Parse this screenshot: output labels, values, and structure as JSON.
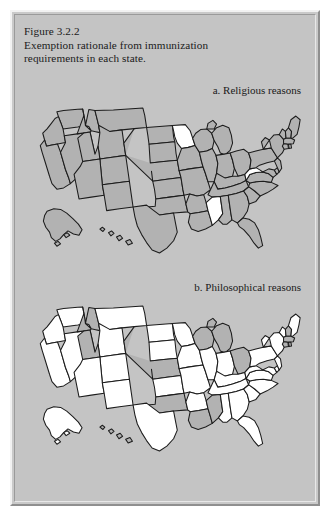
{
  "figure": {
    "number": "Figure 3.2.2",
    "caption_line1": "Exemption rationale from immunization",
    "caption_line2": "requirements in each state.",
    "panel_a_label": "a. Religious reasons",
    "panel_b_label": "b. Philosophical reasons"
  },
  "legend": {
    "shaded_meaning": "exemption allowed",
    "shaded_color": "#b2b2b2",
    "unshaded_color": "#ffffff",
    "outline_color": "#1c1c1c",
    "background_color": "#c4c4c4"
  },
  "chart_data": {
    "type": "map",
    "title": "Exemption rationale from immunization requirements in each state.",
    "subtitle": "Figure 3.2.2",
    "maps": [
      {
        "id": "a",
        "label": "a. Religious reasons",
        "shaded_color": "#b2b2b2",
        "unshaded_color": "#ffffff",
        "values": {
          "AL": 1,
          "AK": 1,
          "AZ": 1,
          "AR": 1,
          "CA": 1,
          "CO": 1,
          "CT": 1,
          "DE": 1,
          "FL": 1,
          "GA": 1,
          "HI": 1,
          "ID": 1,
          "IL": 1,
          "IN": 1,
          "IA": 1,
          "KS": 1,
          "KY": 1,
          "LA": 1,
          "ME": 1,
          "MD": 1,
          "MA": 1,
          "MI": 1,
          "MN": 0,
          "MS": 0,
          "MO": 1,
          "MT": 1,
          "NE": 1,
          "NV": 1,
          "NH": 1,
          "NJ": 1,
          "NM": 1,
          "NY": 1,
          "NC": 1,
          "ND": 1,
          "OH": 1,
          "OK": 1,
          "OR": 1,
          "PA": 1,
          "RI": 1,
          "SC": 1,
          "SD": 1,
          "TN": 1,
          "TX": 1,
          "UT": 1,
          "VT": 1,
          "VA": 1,
          "WA": 1,
          "WV": 0,
          "WI": 1,
          "WY": 1
        }
      },
      {
        "id": "b",
        "label": "b. Philosophical reasons",
        "shaded_color": "#b2b2b2",
        "unshaded_color": "#ffffff",
        "values": {
          "AL": 0,
          "AK": 0,
          "AZ": 0,
          "AR": 0,
          "CA": 0,
          "CO": 0,
          "CT": 1,
          "DE": 0,
          "FL": 0,
          "GA": 0,
          "HI": 1,
          "ID": 1,
          "IL": 0,
          "IN": 0,
          "IA": 0,
          "KS": 0,
          "KY": 0,
          "LA": 1,
          "ME": 0,
          "MD": 0,
          "MA": 1,
          "MI": 1,
          "MN": 0,
          "MS": 1,
          "MO": 0,
          "MT": 0,
          "NE": 1,
          "NV": 0,
          "NH": 1,
          "NJ": 0,
          "NM": 0,
          "NY": 0,
          "NC": 0,
          "ND": 0,
          "OH": 1,
          "OK": 1,
          "OR": 0,
          "PA": 0,
          "RI": 1,
          "SC": 0,
          "SD": 0,
          "TN": 0,
          "TX": 0,
          "UT": 1,
          "VT": 0,
          "VA": 0,
          "WA": 0,
          "WV": 0,
          "WI": 1,
          "WY": 0
        }
      }
    ],
    "value_meanings": {
      "0": "unshaded (white)",
      "1": "shaded (gray)"
    },
    "state_names": {
      "AL": "Alabama",
      "AK": "Alaska",
      "AZ": "Arizona",
      "AR": "Arkansas",
      "CA": "California",
      "CO": "Colorado",
      "CT": "Connecticut",
      "DE": "Delaware",
      "FL": "Florida",
      "GA": "Georgia",
      "HI": "Hawaii",
      "ID": "Idaho",
      "IL": "Illinois",
      "IN": "Indiana",
      "IA": "Iowa",
      "KS": "Kansas",
      "KY": "Kentucky",
      "LA": "Louisiana",
      "ME": "Maine",
      "MD": "Maryland",
      "MA": "Massachusetts",
      "MI": "Michigan",
      "MN": "Minnesota",
      "MS": "Mississippi",
      "MO": "Missouri",
      "MT": "Montana",
      "NE": "Nebraska",
      "NV": "Nevada",
      "NH": "New Hampshire",
      "NJ": "New Jersey",
      "NM": "New Mexico",
      "NY": "New York",
      "NC": "North Carolina",
      "ND": "North Dakota",
      "OH": "Ohio",
      "OK": "Oklahoma",
      "OR": "Oregon",
      "PA": "Pennsylvania",
      "RI": "Rhode Island",
      "SC": "South Carolina",
      "SD": "South Dakota",
      "TN": "Tennessee",
      "TX": "Texas",
      "UT": "Utah",
      "VT": "Vermont",
      "VA": "Virginia",
      "WA": "Washington",
      "WV": "West Virginia",
      "WI": "Wisconsin",
      "WY": "Wyoming"
    }
  }
}
